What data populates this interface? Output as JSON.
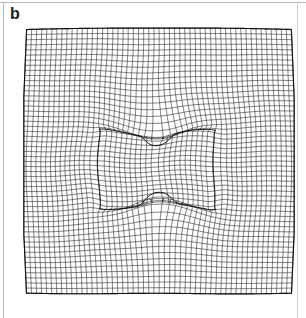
{
  "figure": {
    "panel_label": "b",
    "caption_text": "",
    "background_color": "#ffffff",
    "line_color": "#1a1a1a",
    "rule_color": "#b9b9b9"
  },
  "chart_data": {
    "type": "mesh",
    "title": "",
    "subtitle": "",
    "xlabel": "",
    "ylabel": "",
    "grid": true,
    "legend": false,
    "legend_position": "none",
    "outer_boundary": {
      "shape": "square",
      "x_range": [
        27,
        291
      ],
      "y_range": [
        29,
        294
      ],
      "edge_bowing": "slight convex bowing outward on all four edges"
    },
    "inclusion_boundary": {
      "shape": "square",
      "x_range": [
        103,
        210
      ],
      "y_range": [
        128,
        212
      ],
      "top_feature": "downward V notch centred at x = 157",
      "bottom_feature": "upward triangular peak centred at x = 157",
      "left_feature": "concave inward curve",
      "right_feature": "convex outward bulge"
    },
    "grid_divisions": {
      "x": 52,
      "y": 52
    },
    "axis_ranges": {
      "x": [
        0,
        1
      ],
      "y": [
        0,
        1
      ]
    },
    "deformation_field": {
      "type": "radial-plus-dipole",
      "notch_center": [
        157,
        134
      ],
      "peak_center": [
        157,
        205
      ],
      "notch_depth": 0.26,
      "peak_height": 0.3,
      "far_field_strain": 0.04
    }
  }
}
